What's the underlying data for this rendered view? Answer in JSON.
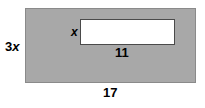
{
  "figure": {
    "type": "geometry-diagram",
    "colors": {
      "shaded_fill": "#a8a8a8",
      "shaded_border": "#8a8a8a",
      "cutout_fill": "#ffffff",
      "cutout_border": "#4a4a4a",
      "label_text": "#000000",
      "background": "#ffffff"
    },
    "outer_rectangle": {
      "name": "shaded-rectangle",
      "height_label": "3x",
      "height_label_number": "3",
      "height_label_variable": "x",
      "width_label": "17"
    },
    "inner_rectangle": {
      "name": "white-cutout-rectangle",
      "height_label": "x",
      "width_label": "11"
    }
  },
  "chart_data": {
    "type": "diagram",
    "title": "",
    "shapes": [
      {
        "id": "outer",
        "kind": "rectangle",
        "fill": "shaded",
        "width_label": "17",
        "height_label": "3x"
      },
      {
        "id": "inner",
        "kind": "rectangle",
        "fill": "white",
        "width_label": "11",
        "height_label": "x"
      }
    ],
    "labels": [
      "3x",
      "x",
      "11",
      "17"
    ]
  }
}
